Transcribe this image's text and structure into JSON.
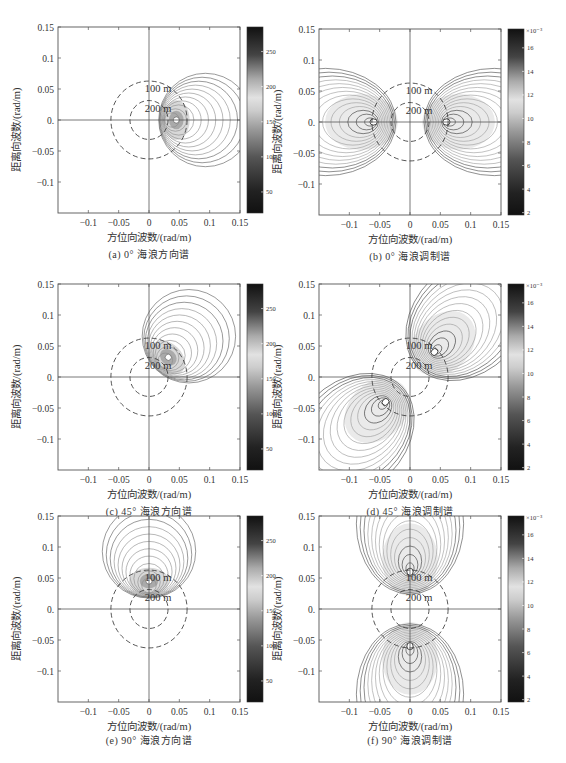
{
  "figure": {
    "xlabel": "方位向波数/(rad/m)",
    "ylabel": "距离向波数/(rad/m)",
    "ring_labels": [
      "100 m",
      "200 m"
    ],
    "x_ticks": [
      "-0.1",
      "-0.05",
      "0",
      "0.05",
      "0.1",
      "0.15"
    ],
    "y_ticks": [
      "0.15",
      "0.1",
      "0.05",
      "0.",
      "-0.05",
      "-0.1"
    ]
  },
  "panels": [
    {
      "id": "a",
      "caption": "(a) 0°  海浪方向谱",
      "kind": "direction",
      "angle_deg": 0,
      "colorbar": {
        "ticks": [
          "250",
          "200",
          "150",
          "100",
          "50"
        ],
        "exponent": ""
      }
    },
    {
      "id": "b",
      "caption": "(b) 0°  海浪调制谱",
      "kind": "modulation",
      "angle_deg": 0,
      "colorbar": {
        "ticks": [
          "16",
          "14",
          "12",
          "10",
          "8",
          "6",
          "4",
          "2"
        ],
        "exponent": "×10⁻³"
      }
    },
    {
      "id": "c",
      "caption": "(c) 45°  海浪方向谱",
      "kind": "direction",
      "angle_deg": 45,
      "colorbar": {
        "ticks": [
          "250",
          "200",
          "150",
          "100",
          "50"
        ],
        "exponent": ""
      }
    },
    {
      "id": "d",
      "caption": "(d) 45°  海浪调制谱",
      "kind": "modulation",
      "angle_deg": 45,
      "colorbar": {
        "ticks": [
          "16",
          "14",
          "12",
          "10",
          "8",
          "6",
          "4",
          "2"
        ],
        "exponent": "×10⁻³"
      }
    },
    {
      "id": "e",
      "caption": "(e) 90°  海浪方向谱",
      "kind": "direction",
      "angle_deg": 90,
      "colorbar": {
        "ticks": [
          "250",
          "200",
          "150",
          "100",
          "50"
        ],
        "exponent": ""
      }
    },
    {
      "id": "f",
      "caption": "(f) 90°  海浪调制谱",
      "kind": "modulation",
      "angle_deg": 90,
      "colorbar": {
        "ticks": [
          "16",
          "14",
          "12",
          "10",
          "8",
          "6",
          "4",
          "2"
        ],
        "exponent": "×10⁻³"
      }
    }
  ],
  "chart_data": [
    {
      "type": "heatmap",
      "title": "(a) 0° 海浪方向谱",
      "xlabel": "方位向波数/(rad/m)",
      "ylabel": "距离向波数/(rad/m)",
      "xlim": [
        -0.15,
        0.15
      ],
      "ylim": [
        -0.15,
        0.15
      ],
      "peak": [
        0.04,
        0.0
      ],
      "colorbar_range": [
        20,
        280
      ],
      "annotations": [
        "100 m",
        "200 m"
      ],
      "rings_radius": [
        0.0628,
        0.0314
      ]
    },
    {
      "type": "heatmap",
      "title": "(b) 0° 海浪调制谱",
      "xlabel": "方位向波数/(rad/m)",
      "ylabel": "距离向波数/(rad/m)",
      "xlim": [
        -0.15,
        0.15
      ],
      "ylim": [
        -0.15,
        0.15
      ],
      "peaks": [
        [
          -0.06,
          0.0
        ],
        [
          0.06,
          0.0
        ]
      ],
      "colorbar_range": [
        0.002,
        0.017
      ],
      "annotations": [
        "100 m",
        "200 m"
      ]
    },
    {
      "type": "heatmap",
      "title": "(c) 45° 海浪方向谱",
      "xlabel": "方位向波数/(rad/m)",
      "ylabel": "距离向波数/(rad/m)",
      "xlim": [
        -0.15,
        0.15
      ],
      "ylim": [
        -0.15,
        0.15
      ],
      "peak": [
        0.03,
        0.03
      ],
      "colorbar_range": [
        20,
        280
      ],
      "annotations": [
        "100 m",
        "200 m"
      ]
    },
    {
      "type": "heatmap",
      "title": "(d) 45° 海浪调制谱",
      "xlabel": "方位向波数/(rad/m)",
      "ylabel": "距离向波数/(rad/m)",
      "xlim": [
        -0.15,
        0.15
      ],
      "ylim": [
        -0.15,
        0.15
      ],
      "peaks": [
        [
          0.04,
          0.04
        ],
        [
          -0.04,
          -0.04
        ]
      ],
      "colorbar_range": [
        0.002,
        0.017
      ],
      "annotations": [
        "100 m",
        "200 m"
      ]
    },
    {
      "type": "heatmap",
      "title": "(e) 90° 海浪方向谱",
      "xlabel": "方位向波数/(rad/m)",
      "ylabel": "距离向波数/(rad/m)",
      "xlim": [
        -0.15,
        0.15
      ],
      "ylim": [
        -0.15,
        0.15
      ],
      "peak": [
        0.0,
        0.04
      ],
      "colorbar_range": [
        20,
        280
      ],
      "annotations": [
        "100 m",
        "200 m"
      ]
    },
    {
      "type": "heatmap",
      "title": "(f) 90° 海浪调制谱",
      "xlabel": "方位向波数/(rad/m)",
      "ylabel": "距离向波数/(rad/m)",
      "xlim": [
        -0.15,
        0.15
      ],
      "ylim": [
        -0.15,
        0.15
      ],
      "peaks": [
        [
          0.0,
          0.06
        ],
        [
          0.0,
          -0.06
        ]
      ],
      "colorbar_range": [
        0.002,
        0.017
      ],
      "annotations": [
        "100 m",
        "200 m"
      ]
    }
  ]
}
